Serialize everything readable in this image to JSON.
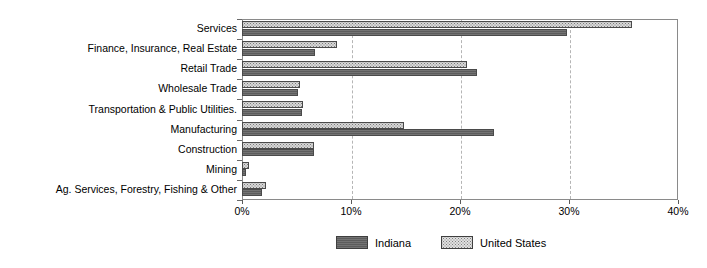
{
  "chart_data": {
    "type": "bar",
    "orientation": "horizontal",
    "title": "",
    "subtitle": "",
    "xlabel": "",
    "ylabel": "",
    "xlim": [
      0,
      40
    ],
    "xtick_labels": [
      "0%",
      "10%",
      "20%",
      "30%",
      "40%"
    ],
    "xticks": [
      0,
      10,
      20,
      30,
      40
    ],
    "grid": "vertical-dashed",
    "legend_position": "bottom-center",
    "categories": [
      "Services",
      "Finance, Insurance, Real Estate",
      "Retail Trade",
      "Wholesale Trade",
      "Transportation & Public Utilities.",
      "Manufacturing",
      "Construction",
      "Mining",
      "Ag. Services, Forestry, Fishing & Other"
    ],
    "series": [
      {
        "name": "Indiana",
        "color": "#5c5c5c",
        "pattern": "solid-dark",
        "values": [
          29.8,
          6.7,
          21.6,
          5.1,
          5.5,
          23.1,
          6.6,
          0.4,
          1.8
        ]
      },
      {
        "name": "United States",
        "color": "#d8d8d8",
        "pattern": "dotted-light",
        "values": [
          35.8,
          8.7,
          20.6,
          5.3,
          5.6,
          14.9,
          6.6,
          0.6,
          2.2
        ]
      }
    ]
  },
  "legend": {
    "items": [
      {
        "label": "Indiana",
        "swatch": "indiana-swatch"
      },
      {
        "label": "United States",
        "swatch": "united-states-swatch"
      }
    ]
  }
}
